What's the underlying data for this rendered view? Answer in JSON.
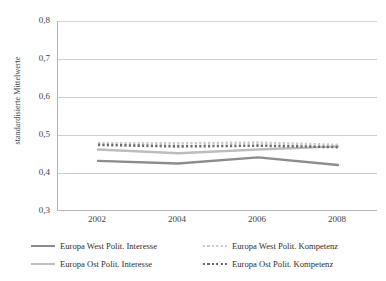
{
  "chart_data": {
    "type": "line",
    "title": "",
    "xlabel": "",
    "ylabel": "standardisierte Mittelwerte",
    "x": [
      2002,
      2004,
      2006,
      2008
    ],
    "xtick_labels": [
      "2002",
      "2004",
      "2006",
      "2008"
    ],
    "ytick_labels": [
      "0,8",
      "0,7",
      "0,6",
      "0,5",
      "0,4",
      "0,3"
    ],
    "ytick_values": [
      0.8,
      0.7,
      0.6,
      0.5,
      0.4,
      0.3
    ],
    "ylim": [
      0.3,
      0.8
    ],
    "grid": "horizontal",
    "legend_position": "bottom",
    "series": [
      {
        "name": "Europa West Polit. Interesse",
        "style": "solid",
        "color": "#8c8c8c",
        "values": [
          0.432,
          0.425,
          0.441,
          0.421
        ]
      },
      {
        "name": "Europa Ost Polit. Interesse",
        "style": "solid",
        "color": "#bdbdbd",
        "values": [
          0.462,
          0.452,
          0.462,
          0.47
        ]
      },
      {
        "name": "Europa West Polit. Kompetenz",
        "style": "dotted",
        "color": "#c9c9c9",
        "values": [
          0.478,
          0.478,
          0.48,
          0.474
        ]
      },
      {
        "name": "Europa Ost Polit. Kompetenz",
        "style": "dotted",
        "color": "#6e6e6e",
        "values": [
          0.474,
          0.47,
          0.472,
          0.468
        ]
      }
    ]
  },
  "legend": {
    "left_items": [
      {
        "label": "Europa West Polit. Interesse",
        "series_index": 0
      },
      {
        "label": "Europa Ost Polit. Interesse",
        "series_index": 1
      }
    ],
    "right_items": [
      {
        "label": "Europa West Polit. Kompetenz",
        "series_index": 2
      },
      {
        "label": "Europa Ost Polit. Kompetenz",
        "series_index": 3
      }
    ]
  },
  "colors": {
    "axis": "#b6b6b6",
    "grid": "#cfcfcf",
    "text": "#3f3f3f",
    "background": "#ffffff"
  }
}
